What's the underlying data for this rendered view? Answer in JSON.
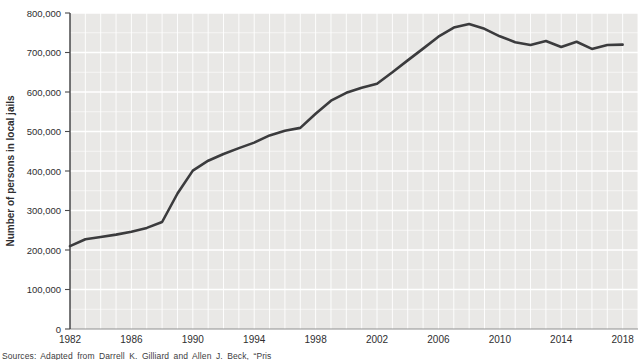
{
  "figure": {
    "source_text": "Sources: Adapted from Darrell K. Gilliard and Allen J. Beck, “Pris",
    "colors": {
      "plot_background": "#e9e8e6",
      "gridline": "#ffffff",
      "data_line": "#3b3b3d",
      "y_axis_line": "#2e2e30",
      "x_axis_line": "#8f8f8f",
      "tick": "#4a4a4c",
      "label_text": "#2e2e30"
    }
  },
  "chart_data": {
    "type": "line",
    "title": "",
    "xlabel": "",
    "ylabel": "Number of persons in local jails",
    "legend": "none",
    "grid": true,
    "plot_background": "gray with white gridlines",
    "xlim": [
      1982,
      2019
    ],
    "ylim": [
      0,
      800000
    ],
    "x_gridline_interval_years": 1,
    "y_gridline_interval": 50000,
    "x_tick_values": [
      1982,
      1986,
      1990,
      1994,
      1998,
      2002,
      2006,
      2010,
      2014,
      2018
    ],
    "x_tick_labels": [
      "1982",
      "1986",
      "1990",
      "1994",
      "1998",
      "2002",
      "2006",
      "2010",
      "2014",
      "2018"
    ],
    "y_tick_values": [
      0,
      100000,
      200000,
      300000,
      400000,
      500000,
      600000,
      700000,
      800000
    ],
    "y_tick_labels": [
      "0",
      "100,000",
      "200,000",
      "300,000",
      "400,000",
      "500,000",
      "600,000",
      "700,000",
      "800,000"
    ],
    "x": [
      1982,
      1983,
      1984,
      1985,
      1986,
      1987,
      1988,
      1989,
      1990,
      1991,
      1992,
      1993,
      1994,
      1995,
      1996,
      1997,
      1998,
      1999,
      2000,
      2001,
      2002,
      2003,
      2004,
      2005,
      2006,
      2007,
      2008,
      2009,
      2010,
      2011,
      2012,
      2013,
      2014,
      2015,
      2016,
      2017,
      2018
    ],
    "series": [
      {
        "name": "Number of persons in local jails",
        "values": [
          210000,
          227000,
          233000,
          239000,
          246000,
          256000,
          271000,
          343000,
          401000,
          426000,
          443000,
          458000,
          472000,
          490000,
          502000,
          509000,
          545000,
          578000,
          598000,
          611000,
          621000,
          650000,
          680000,
          710000,
          740000,
          763000,
          772000,
          760000,
          741000,
          726000,
          719000,
          729000,
          714000,
          727000,
          709000,
          719000,
          720000
        ]
      }
    ]
  }
}
